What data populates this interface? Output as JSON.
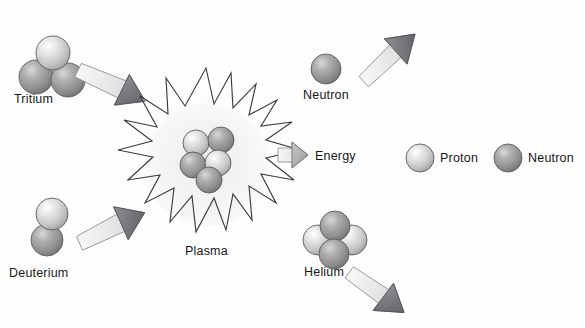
{
  "diagram": {
    "background_color": "#fefefe",
    "text_color": "#17171a"
  },
  "labels": {
    "tritium": "Tritium",
    "deuterium": "Deuterium",
    "plasma": "Plasma",
    "neutron_output": "Neutron",
    "energy": "Energy",
    "helium": "Helium"
  },
  "legend": {
    "items": [
      {
        "label": "Proton",
        "icon": "proton-sphere",
        "color": "#cdcdcd"
      },
      {
        "label": "Neutron",
        "icon": "neutron-sphere",
        "color": "#9a9a9c"
      }
    ]
  },
  "particles": {
    "proton_color": "#d2d2d2",
    "neutron_color": "#969698",
    "outline_color": "#5d5d60"
  },
  "arrows": {
    "tritium_infeed": {
      "name": "arrow-tritium-to-plasma",
      "direction": "down-right"
    },
    "deuterium_infeed": {
      "name": "arrow-deuterium-to-plasma",
      "direction": "up-right"
    },
    "neutron_out": {
      "name": "arrow-neutron-out",
      "direction": "up-right"
    },
    "energy_out": {
      "name": "arrow-energy-out",
      "direction": "right"
    },
    "helium_out": {
      "name": "arrow-helium-out",
      "direction": "down-right"
    },
    "shaft_color": "#e9e9e9",
    "head_color": "#6c6c70"
  },
  "plasma": {
    "name": "plasma-burst",
    "cloud_color": "#efeeee",
    "spike_color": "#3c3c40",
    "core_particle_count": 5
  },
  "clusters": {
    "tritium": {
      "protons": 1,
      "neutrons": 2
    },
    "deuterium": {
      "protons": 1,
      "neutrons": 1
    },
    "helium": {
      "protons": 2,
      "neutrons": 2
    }
  }
}
